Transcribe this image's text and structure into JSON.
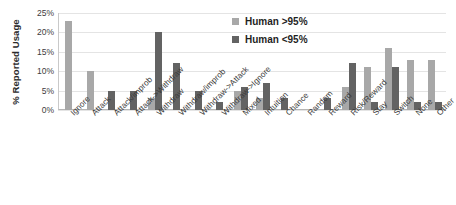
{
  "chart_data": {
    "type": "bar",
    "title": "",
    "xlabel": "",
    "ylabel": "% Reported Usage",
    "ylim": [
      0,
      25
    ],
    "ytick_labels": [
      "25%",
      "20%",
      "15%",
      "10%",
      "5%",
      "0%"
    ],
    "ytick_values": [
      25,
      20,
      15,
      10,
      5,
      0
    ],
    "grid": true,
    "legend_position": "upper-center",
    "categories": [
      "Ignore",
      "Attack",
      "Attack/improb",
      "Attack->Withdraw",
      "Withdraw",
      "Withdraw/improb",
      "Withdraw->Attack",
      "Withdraw->Ignore",
      "Mixed",
      "Intuition",
      "Chance",
      "Random",
      "Reward",
      "Risk/Reward",
      "Stay",
      "Switch",
      "None",
      "Other"
    ],
    "series": [
      {
        "name": "Human >95%",
        "color": "#a8a8a8",
        "values": [
          23,
          10,
          0,
          0,
          3,
          0,
          0,
          0,
          5,
          3,
          0,
          0,
          0,
          6,
          11,
          16,
          13,
          13
        ]
      },
      {
        "name": "Human <95%",
        "color": "#636363",
        "values": [
          0,
          0,
          5,
          5,
          20,
          12,
          5,
          2,
          6,
          7,
          3,
          0,
          3,
          12,
          2,
          11,
          2,
          2
        ]
      }
    ]
  },
  "legend": {
    "items": [
      {
        "label": "Human >95%",
        "swatch": "light"
      },
      {
        "label": "Human <95%",
        "swatch": "dark"
      }
    ]
  },
  "axis": {
    "y_title": "% Reported Usage"
  }
}
